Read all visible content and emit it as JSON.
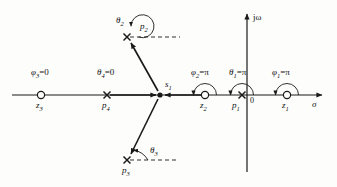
{
  "figure": {
    "type": "pole-zero-root-locus-diagram",
    "axes": {
      "real_axis_label": "σ",
      "imag_axis_label": "jω",
      "origin_label": "0",
      "real_axis_y": 95,
      "imag_axis_x": 247
    },
    "test_point": {
      "name": "s1",
      "label": "s",
      "sub": "1",
      "x": 160,
      "y": 95
    },
    "zeros": [
      {
        "name": "z1",
        "label": "z",
        "sub": "1",
        "x": 287,
        "y": 95,
        "marker": "circle-marker"
      },
      {
        "name": "z2",
        "label": "z",
        "sub": "2",
        "x": 205,
        "y": 95,
        "marker": "circle-marker"
      },
      {
        "name": "z3",
        "label": "z",
        "sub": "3",
        "x": 41,
        "y": 95,
        "marker": "circle-marker"
      }
    ],
    "poles": [
      {
        "name": "p1",
        "label": "p",
        "sub": "1",
        "x": 242,
        "y": 95,
        "marker": "cross-marker"
      },
      {
        "name": "p2",
        "label": "p",
        "sub": "2",
        "x": 127,
        "y": 37,
        "marker": "cross-marker"
      },
      {
        "name": "p3",
        "label": "p",
        "sub": "3",
        "x": 127,
        "y": 160,
        "marker": "cross-marker"
      },
      {
        "name": "p4",
        "label": "p",
        "sub": "4",
        "x": 107,
        "y": 95,
        "marker": "cross-marker"
      }
    ],
    "angle_annotations": [
      {
        "name": "phi1",
        "text": "φ1=π",
        "symbol": "φ",
        "sub": "1",
        "value": "π",
        "at": "z1",
        "arc": "semicircle-ccw"
      },
      {
        "name": "phi2",
        "text": "φ2=π",
        "symbol": "φ",
        "sub": "2",
        "value": "π",
        "at": "z2",
        "arc": "semicircle-ccw"
      },
      {
        "name": "phi3",
        "text": "φ3=0",
        "symbol": "φ",
        "sub": "3",
        "value": "0",
        "at": "z3",
        "arc": "none"
      },
      {
        "name": "theta1",
        "text": "θ1=π",
        "symbol": "θ",
        "sub": "1",
        "value": "π",
        "at": "p1",
        "arc": "semicircle-ccw"
      },
      {
        "name": "theta2",
        "text": "θ2",
        "symbol": "θ",
        "sub": "2",
        "value": "",
        "at": "p2",
        "arc": "full-circle"
      },
      {
        "name": "theta3",
        "text": "θ3",
        "symbol": "θ",
        "sub": "3",
        "value": "",
        "at": "p3",
        "arc": "small-arc"
      },
      {
        "name": "theta4",
        "text": "θ4=0",
        "symbol": "θ",
        "sub": "4",
        "value": "0",
        "at": "p4",
        "arc": "none"
      }
    ],
    "vectors": [
      {
        "name": "vector-p2-to-s1",
        "from": "p2",
        "to": "s1"
      },
      {
        "name": "vector-p3-to-s1",
        "from": "p3",
        "to": "s1"
      },
      {
        "name": "vector-p4-to-s1",
        "from": "p4",
        "to": "s1"
      },
      {
        "name": "vector-z2-to-s1",
        "from": "z2",
        "to": "s1"
      }
    ],
    "colors": {
      "stroke": "#1a1a1a",
      "background": "#fdfdfc"
    }
  },
  "labels": {
    "sigma": "σ",
    "jomega": "jω",
    "zero_origin": "0",
    "s1_main": "s",
    "s1_sub": "1",
    "z1_main": "z",
    "z1_sub": "1",
    "z2_main": "z",
    "z2_sub": "2",
    "z3_main": "z",
    "z3_sub": "3",
    "p1_main": "p",
    "p1_sub": "1",
    "p2_main": "p",
    "p2_sub": "2",
    "p3_main": "p",
    "p3_sub": "3",
    "p4_main": "p",
    "p4_sub": "4",
    "phi1_sym": "φ",
    "phi1_sub": "1",
    "phi1_val": "=π",
    "phi2_sym": "φ",
    "phi2_sub": "2",
    "phi2_val": "=π",
    "phi3_sym": "φ",
    "phi3_sub": "3",
    "phi3_val": "=0",
    "theta1_sym": "θ",
    "theta1_sub": "1",
    "theta1_val": "=π",
    "theta2_sym": "θ",
    "theta2_sub": "2",
    "theta2_val": "",
    "theta3_sym": "θ",
    "theta3_sub": "3",
    "theta3_val": "",
    "theta4_sym": "θ",
    "theta4_sub": "4",
    "theta4_val": "=0"
  }
}
